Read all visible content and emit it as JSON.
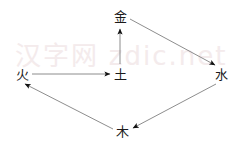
{
  "diagram": {
    "background_color": "#ffffff",
    "line_color": "#808080",
    "arrow_color": "#1a1a1a",
    "label_color": "#1a1a1a",
    "width": 242,
    "height": 151,
    "nodes": [
      {
        "id": "jin",
        "label": "金",
        "x": 120,
        "y": 16,
        "meaning": "metal"
      },
      {
        "id": "shui",
        "label": "水",
        "x": 221,
        "y": 74,
        "meaning": "water"
      },
      {
        "id": "mu",
        "label": "木",
        "x": 122,
        "y": 131,
        "meaning": "wood"
      },
      {
        "id": "huo",
        "label": "火",
        "x": 22,
        "y": 74,
        "meaning": "fire"
      },
      {
        "id": "tu",
        "label": "土",
        "x": 120,
        "y": 74,
        "meaning": "earth"
      }
    ],
    "edges": [
      {
        "id": "tu-to-jin",
        "from": "土",
        "to": "金",
        "x1": 120,
        "y1": 64,
        "x2": 120,
        "y2": 29
      },
      {
        "id": "jin-to-shui",
        "from": "金",
        "to": "水",
        "x1": 130,
        "y1": 19,
        "x2": 215,
        "y2": 65
      },
      {
        "id": "shui-to-mu",
        "from": "水",
        "to": "木",
        "x1": 216,
        "y1": 84,
        "x2": 133,
        "y2": 128
      },
      {
        "id": "mu-to-huo",
        "from": "木",
        "to": "火",
        "x1": 113,
        "y1": 129,
        "x2": 25,
        "y2": 84
      },
      {
        "id": "huo-to-tu",
        "from": "火",
        "to": "土",
        "x1": 32,
        "y1": 74,
        "x2": 110,
        "y2": 74
      }
    ]
  },
  "watermark": {
    "text": "汉字网 zdic.net",
    "color": "#f3e9ea"
  }
}
